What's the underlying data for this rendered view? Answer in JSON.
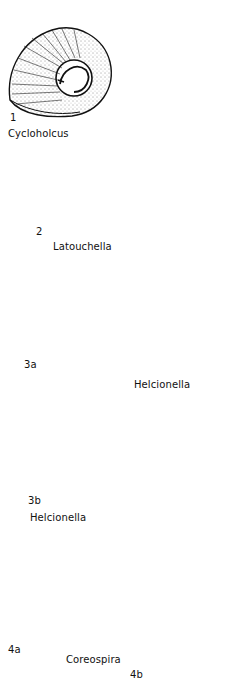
{
  "plate": {
    "background": "#ffffff",
    "ink": "#111111",
    "figures": [
      {
        "id": "1",
        "number_label": "1",
        "genus": "Cycloholcus",
        "view": "coiled shell, lateral"
      },
      {
        "id": "2",
        "number_label": "2",
        "genus": "Latouchella",
        "view": "cap-shaped shell, lateral"
      },
      {
        "id": "3a",
        "number_label": "3a",
        "genus": "Helcionella",
        "view": "ribbed cap shell, lateral"
      },
      {
        "id": "3b",
        "number_label": "3b",
        "genus": "Helcionella",
        "view": "ribbed cap shell, oblique"
      },
      {
        "id": "4a",
        "number_label": "4a",
        "genus": "Coreospira",
        "view": "coiled shell, lateral"
      },
      {
        "id": "4b",
        "number_label": "4b",
        "genus": "Coreospira",
        "view": "shell, apertural/front"
      }
    ]
  }
}
